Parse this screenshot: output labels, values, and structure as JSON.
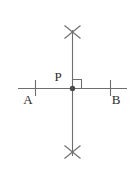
{
  "figure": {
    "background_color": "#ffffff",
    "stroke_color": "#6e6e6e",
    "label_color": "#2b2b2b",
    "labels": {
      "point_p": "P",
      "point_a": "A",
      "point_b": "B"
    },
    "geometry": {
      "horizontal_line": {
        "x1": 18,
        "y1": 88,
        "x2": 127,
        "y2": 88
      },
      "vertical_line": {
        "x1": 72,
        "y1": 30,
        "x2": 72,
        "y2": 156
      },
      "point_p": {
        "cx": 72,
        "cy": 88,
        "r": 2.6
      },
      "right_angle_marker": {
        "x": 72,
        "y": 88,
        "size": 9,
        "quadrant": "upper-right"
      },
      "tick_marks": [
        {
          "name": "tick-left",
          "x": 35,
          "y_top": 80,
          "y_bottom": 96
        },
        {
          "name": "tick-right",
          "x": 110,
          "y_top": 80,
          "y_bottom": 96
        }
      ],
      "arc_crosses": [
        {
          "name": "cross-top",
          "cx": 72,
          "cy": 32,
          "arm": 8
        },
        {
          "name": "cross-bottom",
          "cx": 72,
          "cy": 152,
          "arm": 8
        }
      ],
      "label_positions": {
        "point_p": {
          "x": 58,
          "y": 80
        },
        "point_a": {
          "x": 23,
          "y": 103
        },
        "point_b": {
          "x": 112,
          "y": 103
        }
      }
    }
  }
}
